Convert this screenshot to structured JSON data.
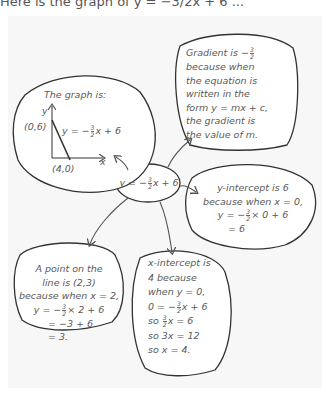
{
  "header_partial_text": "Here is the graph of y = −3/2x + 6 ...",
  "center": {
    "eq_prefix": "y = −",
    "num": "3",
    "den": "2",
    "eq_suffix": "x + 6"
  },
  "gradient_bubble": {
    "line1_prefix": "Gradient is −",
    "num": "3",
    "den": "2",
    "lines": [
      "because when",
      "the equation is",
      "written in the",
      "form  y = mx + c,",
      "the gradient is",
      "the value of m."
    ]
  },
  "graph_bubble": {
    "title": "The graph is:",
    "y_axis": "y",
    "x_axis": "x",
    "point_y": "(0,6)",
    "point_x": "(4,0)",
    "eq_prefix": "y = −",
    "num": "3",
    "den": "2",
    "eq_suffix": "x + 6"
  },
  "yint_bubble": {
    "lines": [
      "y-intercept is 6",
      "because when  x = 0,"
    ],
    "calc_prefix": "y = −",
    "num": "3",
    "den": "2",
    "calc_suffix": "× 0 + 6",
    "result": "= 6"
  },
  "point_bubble": {
    "lines": [
      "A point on the",
      "line is (2,3)",
      "because when  x = 2,"
    ],
    "calc_prefix": "y = −",
    "num": "3",
    "den": "2",
    "calc_suffix": "× 2 + 6",
    "step": "= −3 + 6",
    "result": "= 3."
  },
  "xint_bubble": {
    "lines": [
      "x-intercept is",
      "4 because",
      "when  y = 0,"
    ],
    "calc_prefix": "0 = −",
    "num": "3",
    "den": "2",
    "calc_suffix": "x + 6",
    "so1_prefix": "so ",
    "so1_num": "3",
    "so1_den": "2",
    "so1_suffix": "x = 6",
    "so2": "so 3x = 12",
    "so3": "so x = 4."
  }
}
